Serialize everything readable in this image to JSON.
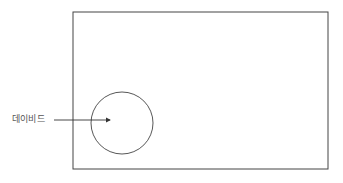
{
  "diagram": {
    "label": "데이비드",
    "colors": {
      "stroke": "#444444",
      "text": "#555555",
      "background": "#ffffff"
    },
    "shapes": {
      "rectangle": {
        "x": 73,
        "y": 12,
        "width": 255,
        "height": 157
      },
      "circle": {
        "cx": 122,
        "cy": 123,
        "r": 31
      },
      "arrow": {
        "x1": 54,
        "y1": 120,
        "x2": 110,
        "y2": 120
      }
    }
  }
}
